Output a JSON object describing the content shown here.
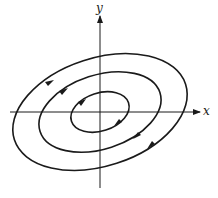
{
  "diagram": {
    "type": "phase-portrait",
    "axes": {
      "x_label": "x",
      "y_label": "y",
      "origin": [
        100,
        112
      ]
    },
    "orbits": [
      {
        "name": "inner",
        "rx": 30,
        "ry": 19,
        "rotation_deg": -18
      },
      {
        "name": "middle",
        "rx": 63,
        "ry": 37,
        "rotation_deg": -18
      },
      {
        "name": "outer",
        "rx": 90,
        "ry": 54,
        "rotation_deg": -18
      }
    ],
    "flow_direction": "clockwise",
    "colors": {
      "stroke": "#1a1a1a",
      "background": "#ffffff"
    }
  }
}
